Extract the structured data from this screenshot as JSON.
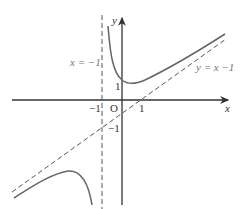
{
  "figure": {
    "axes": {
      "x_label": "x",
      "y_label": "y",
      "origin_label": "O"
    },
    "ticks": {
      "x_neg_one": "−1",
      "x_one": "1",
      "y_one": "1",
      "y_neg_one": "−1"
    },
    "asymptotes": {
      "vertical": {
        "label": "x = −1",
        "equation_x": -1
      },
      "oblique": {
        "label": "y = x −1",
        "slope": 1,
        "intercept": -1
      }
    },
    "curve_color": "#666666",
    "axis_color": "#333333",
    "dash_color": "#555555"
  }
}
